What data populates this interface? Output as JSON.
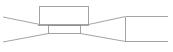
{
  "diagram": {
    "type": "line-drawing",
    "stroke_color": "#8c8c8c",
    "background": "#ffffff",
    "shapes": {
      "top_box": {
        "x": 39.5,
        "y": 6.5,
        "w": 49,
        "h": 18
      },
      "bottom_box": {
        "x": 48.5,
        "y": 26.5,
        "w": 32,
        "h": 8
      },
      "right_box": {
        "x1": 125.5,
        "y1": 16.5,
        "x2": 168,
        "y2": 41.5
      }
    },
    "labels": []
  }
}
